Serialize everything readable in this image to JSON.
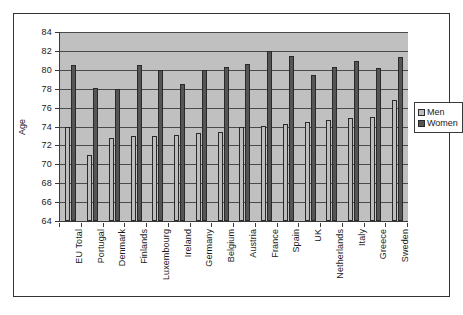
{
  "chart_data": {
    "type": "bar",
    "title": "",
    "xlabel": "",
    "ylabel": "Age",
    "ylim": [
      64,
      84
    ],
    "ytick_step": 2,
    "yticks": [
      64,
      66,
      68,
      70,
      72,
      74,
      76,
      78,
      80,
      82,
      84
    ],
    "grid": true,
    "legend_position": "right",
    "categories": [
      "EU Total",
      "Portugal",
      "Denmark",
      "Finlands",
      "Luxembourg",
      "Ireland",
      "Germany",
      "Belgium",
      "Austria",
      "France",
      "Spain",
      "UK",
      "Netherlands",
      "Italy",
      "Greece",
      "Sweden"
    ],
    "series": [
      {
        "name": "Men",
        "color": "#bdbdbd",
        "values": [
          74.0,
          71.0,
          72.8,
          73.0,
          73.0,
          73.1,
          73.3,
          73.4,
          74.0,
          74.1,
          74.3,
          74.5,
          74.7,
          74.9,
          75.0,
          76.8
        ]
      },
      {
        "name": "Women",
        "color": "#555555",
        "values": [
          80.5,
          78.1,
          78.0,
          80.5,
          80.0,
          78.5,
          80.0,
          80.3,
          80.6,
          82.0,
          81.5,
          79.5,
          80.3,
          80.9,
          80.2,
          81.4
        ]
      }
    ]
  },
  "legend": {
    "entries": [
      {
        "label": "Men"
      },
      {
        "label": "Women"
      }
    ]
  },
  "colors": {
    "plot_background": "#c0c0c0",
    "page_background": "#ffffff",
    "frame_border": "#333333",
    "gridline": "#4a4a4a",
    "men_bar": "#bdbdbd",
    "women_bar": "#555555"
  }
}
